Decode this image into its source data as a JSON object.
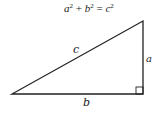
{
  "diagram": {
    "equation": {
      "a": "a",
      "b": "b",
      "c": "c",
      "exp": "2",
      "plus": "+",
      "equals": "="
    },
    "labels": {
      "hypotenuse": "c",
      "vertical_leg": "a",
      "horizontal_leg": "b"
    },
    "vertices": {
      "left": [
        12,
        94
      ],
      "right_angle": [
        143,
        94
      ],
      "top": [
        143,
        21
      ]
    },
    "stroke_color": "#222222"
  }
}
